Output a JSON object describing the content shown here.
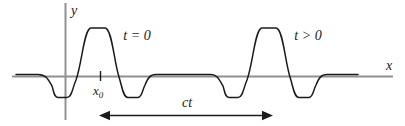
{
  "figure": {
    "labels": {
      "y_axis": "y",
      "x_axis": "x",
      "x0_base": "x",
      "x0_subscript": "0",
      "left_pulse": "t = 0",
      "right_pulse": "t > 0",
      "distance": "ct"
    },
    "colors": {
      "background": "#ffffff",
      "axis": "#909090",
      "curve": "#1b1b1b",
      "text": "#1b1b1b"
    },
    "curve": {
      "path": "M16,74.5 L38,74.5 C46,74.5 48,79 52,86 C54,92 54,97.5 58,97.5 L67,97.5 C72,97.5 72,89 76,80 C82,64 84,28 91,28 L105,28 C112,28 114,62 119,77 C122,86 123,97.5 128,97.5 L138,97.5 C142,97.5 142,91 145,85 C148,78 150,74.5 156,74.5 L211,74.5 C217,74.5 219,79 223,86 C225,92 225,97.5 229,97.5 L238,97.5 C243,97.5 243,89 247,80 C253,64 255,28 262,28 L276,28 C283,28 285,62 290,77 C293,86 294,97.5 299,97.5 L309,97.5 C313,97.5 313,91 316,85 C319,78 321,74.5 327,74.5 L358,74.5"
    }
  }
}
